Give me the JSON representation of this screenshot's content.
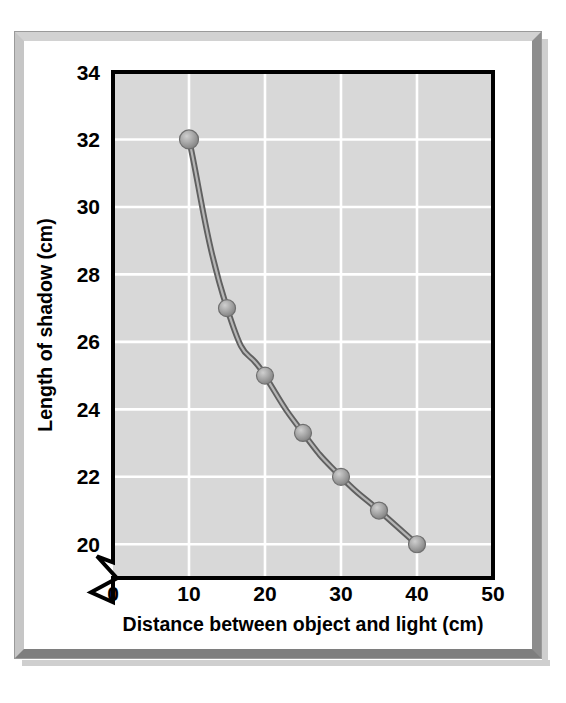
{
  "figure": {
    "frame_style": "beveled-gray-border",
    "background_color": "#ffffff",
    "plot_background_color": "#d8d8d8",
    "gridline_color": "#ffffff",
    "axis_color": "#000000",
    "series_line_color": "#7a7a7a",
    "marker_color": "#9a9a9a",
    "marker_highlight_color": "#c4c4c4"
  },
  "chart_data": {
    "type": "line",
    "title": "",
    "xlabel": "Distance between object and light (cm)",
    "ylabel": "Length of shadow (cm)",
    "xlim": [
      0,
      50
    ],
    "ylim": [
      19,
      34
    ],
    "y_axis_break": true,
    "y_axis_break_note": "zigzag break between 0 and 20",
    "grid": true,
    "legend": "none",
    "xticks": [
      0,
      10,
      20,
      30,
      40,
      50
    ],
    "xtick_labels": [
      "0",
      "10",
      "20",
      "30",
      "40",
      "50"
    ],
    "yticks": [
      20,
      22,
      24,
      26,
      28,
      30,
      32,
      34
    ],
    "ytick_labels": [
      "20",
      "22",
      "24",
      "26",
      "28",
      "30",
      "32",
      "34"
    ],
    "x": [
      10,
      15,
      20,
      25,
      30,
      35,
      40
    ],
    "values": [
      32,
      27,
      25,
      23.3,
      22,
      21,
      20
    ],
    "points": [
      {
        "x": 10,
        "y": 32
      },
      {
        "x": 15,
        "y": 27
      },
      {
        "x": 20,
        "y": 25
      },
      {
        "x": 25,
        "y": 23.3
      },
      {
        "x": 30,
        "y": 22
      },
      {
        "x": 35,
        "y": 21
      },
      {
        "x": 40,
        "y": 20
      }
    ],
    "series": [
      {
        "name": "Length of shadow",
        "values": [
          32,
          27,
          25,
          23.3,
          22,
          21,
          20
        ]
      }
    ]
  }
}
